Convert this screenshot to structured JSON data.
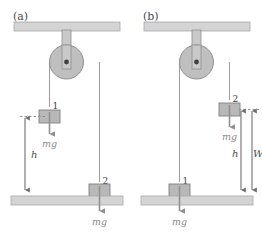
{
  "figure": {
    "width": 262,
    "height": 240,
    "background": "#ffffff"
  },
  "colors": {
    "surface_fill": "#d4d4d4",
    "surface_stroke": "#a8a8a8",
    "pulley_fill": "#bfbfbf",
    "pulley_stroke": "#8f8f8f",
    "bracket_fill": "#c9c9c9",
    "bracket_stroke": "#8f8f8f",
    "axle": "#404040",
    "block_fill": "#b8b8b8",
    "block_stroke": "#808080",
    "rope": "#a0a0a0",
    "force_arrow": "#909090",
    "dim_arrow": "#707070",
    "dashed_guide": "#8a8a8a",
    "text_dark": "#3d3d3d",
    "text_gray": "#8a8a8a"
  },
  "panels": [
    {
      "id": "a",
      "label": "(a)",
      "blocks": [
        {
          "number": "1",
          "position": "raised",
          "force_label": "mg"
        },
        {
          "number": "2",
          "position": "on-floor",
          "force_label": "mg"
        }
      ],
      "dimensions": [
        {
          "symbol": "h",
          "from": "block-1-level",
          "to": "floor"
        }
      ]
    },
    {
      "id": "b",
      "label": "(b)",
      "blocks": [
        {
          "number": "2",
          "position": "raised",
          "force_label": "mg"
        },
        {
          "number": "1",
          "position": "on-floor",
          "force_label": "mg"
        }
      ],
      "dimensions": [
        {
          "symbol": "h",
          "from": "block-2-level",
          "to": "floor"
        },
        {
          "symbol": "W",
          "from": "block-2-level",
          "to": "floor"
        }
      ]
    }
  ]
}
